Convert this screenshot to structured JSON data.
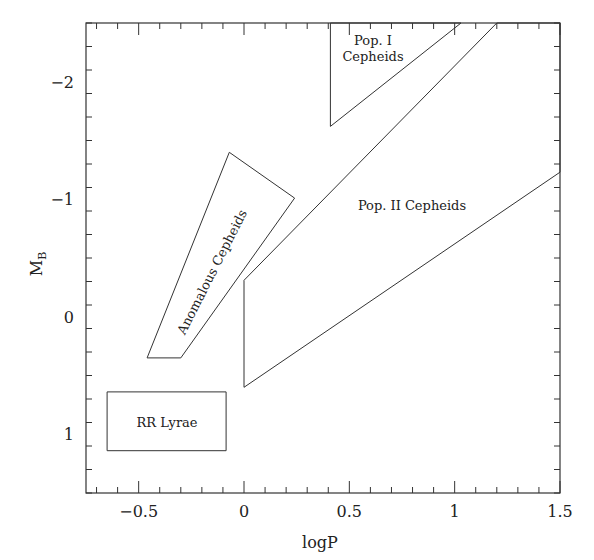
{
  "chart_data": {
    "type": "diagram",
    "title": "",
    "xlabel": "logP",
    "ylabel": "M",
    "ylabel_subscript": "B",
    "xlim": [
      -0.75,
      1.5
    ],
    "ylim": [
      1.5,
      -2.5
    ],
    "y_inverted": true,
    "grid": false,
    "legend": null,
    "x_ticks": [
      {
        "value": -0.5,
        "label": "−0.5"
      },
      {
        "value": 0,
        "label": "0"
      },
      {
        "value": 0.5,
        "label": "0.5"
      },
      {
        "value": 1,
        "label": "1"
      },
      {
        "value": 1.5,
        "label": "1.5"
      }
    ],
    "y_ticks": [
      {
        "value": -2,
        "label": "−2"
      },
      {
        "value": -1,
        "label": "−1"
      },
      {
        "value": 0,
        "label": "0"
      },
      {
        "value": 1,
        "label": "1"
      }
    ],
    "x_minor_step": 0.1,
    "y_minor_step": 0.2,
    "regions": [
      {
        "name": "Pop. I Cepheids",
        "label_lines": [
          "Pop. I",
          "Cepheids"
        ],
        "polygon": [
          [
            0.41,
            -2.5
          ],
          [
            0.41,
            -1.62
          ],
          [
            1.03,
            -2.5
          ]
        ]
      },
      {
        "name": "Pop. II Cepheids",
        "label_lines": [
          "Pop. II Cepheids"
        ],
        "polygon": [
          [
            0.0,
            0.6
          ],
          [
            0.0,
            -0.31
          ],
          [
            1.2,
            -2.5
          ],
          [
            1.5,
            -2.5
          ],
          [
            1.5,
            -1.23
          ]
        ]
      },
      {
        "name": "Anomalous Cepheids",
        "label_lines": [
          "Anomalous Cepheids"
        ],
        "polygon": [
          [
            -0.07,
            -1.4
          ],
          [
            0.24,
            -1.01
          ],
          [
            -0.3,
            0.35
          ],
          [
            -0.46,
            0.35
          ]
        ]
      },
      {
        "name": "RR Lyrae",
        "label_lines": [
          "RR Lyrae"
        ],
        "polygon": [
          [
            -0.65,
            0.64
          ],
          [
            -0.085,
            0.64
          ],
          [
            -0.085,
            1.14
          ],
          [
            -0.65,
            1.14
          ]
        ]
      }
    ]
  }
}
